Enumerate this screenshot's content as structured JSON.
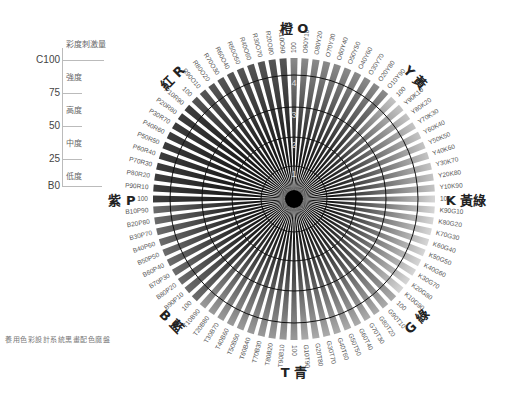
{
  "caption": "養用色彩設計系統黑畫配色魔盤",
  "legend": {
    "header": "彩度刺激量",
    "ticks": [
      "C100",
      "75",
      "50",
      "25",
      "B0"
    ],
    "levels": [
      "強度",
      "高度",
      "中度",
      "低度"
    ]
  },
  "ring_labels": [
    "1",
    "2",
    "3",
    "4"
  ],
  "hues": [
    {
      "code": "O",
      "name": "橙",
      "label": "橙 O",
      "color": "#8a8a8a"
    },
    {
      "code": "Y",
      "name": "黃",
      "label": "Y 黃",
      "color": "#c4c4c4"
    },
    {
      "code": "K",
      "name": "黃綠",
      "label": "K 黃綠",
      "color": "#d6d6d6"
    },
    {
      "code": "G",
      "name": "綠",
      "label": "G 綠",
      "color": "#ababab"
    },
    {
      "code": "T",
      "name": "青",
      "label": "T 青",
      "color": "#9a9a9a"
    },
    {
      "code": "B",
      "name": "藍",
      "label": "B 藍",
      "color": "#6c6c6c"
    },
    {
      "code": "P",
      "name": "紫",
      "label": "紫 P",
      "color": "#3c3c3c"
    },
    {
      "code": "R",
      "name": "紅",
      "label": "紅 R",
      "color": "#555555"
    }
  ],
  "spoke_labels": [
    "100",
    "O90Y10",
    "O80Y20",
    "O70Y30",
    "O60Y40",
    "O50Y50",
    "O40Y60",
    "O30Y70",
    "O20Y80",
    "O10Y90",
    "100",
    "Y90K10",
    "Y80K20",
    "Y70K30",
    "Y60K40",
    "Y50K50",
    "Y40K60",
    "Y30K70",
    "Y20K80",
    "Y10K90",
    "100",
    "K90G10",
    "K80G20",
    "K70G30",
    "K60G40",
    "K50G50",
    "K40G60",
    "K30G70",
    "K20G80",
    "K10G90",
    "100",
    "G90T10",
    "G80T20",
    "G70T30",
    "G60T40",
    "G50T50",
    "G40T60",
    "G30T70",
    "G20T80",
    "G10T90",
    "100",
    "T90B10",
    "T80B20",
    "T70B30",
    "T60B40",
    "T50B50",
    "T40B60",
    "T30B70",
    "T20B80",
    "T10B90",
    "100",
    "B90P10",
    "B80P20",
    "B70P30",
    "B60P40",
    "B50P50",
    "B40P60",
    "B30P70",
    "B20P80",
    "B10P90",
    "100",
    "P90R10",
    "P80R20",
    "P70R30",
    "P60R40",
    "P50R50",
    "P40R60",
    "P30R70",
    "P20R80",
    "P10R90",
    "100",
    "R90O10",
    "R80O20",
    "R70O30",
    "R60O40",
    "R50O50",
    "R40O60",
    "R30O70",
    "R20O80",
    "R10O90"
  ],
  "geometry": {
    "cx": 294,
    "cy": 199,
    "r_outer": 141,
    "r_label": 146,
    "rings": [
      33,
      62,
      92,
      124
    ],
    "r_title": 172
  }
}
